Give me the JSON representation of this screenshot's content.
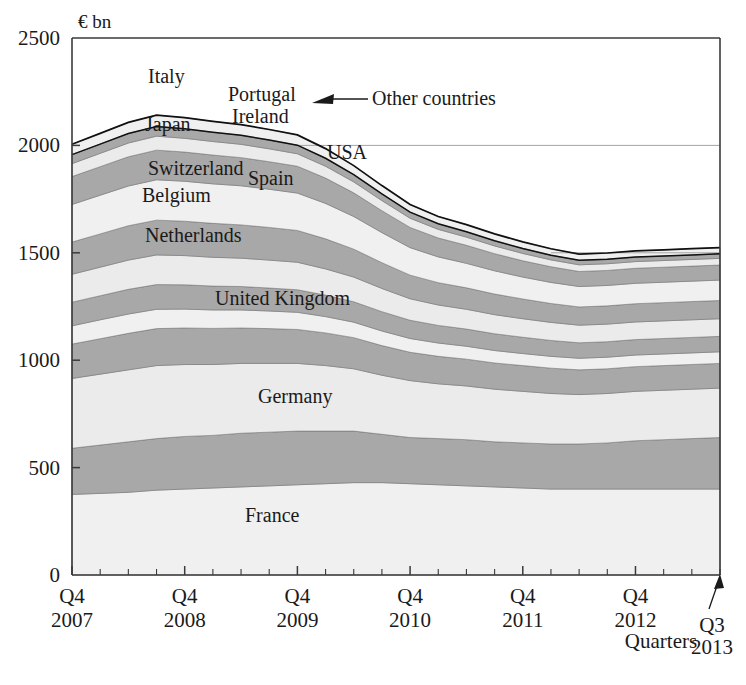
{
  "chart_data": {
    "type": "area",
    "title": "",
    "subtitle": "",
    "unit_label": "€ bn",
    "xlabel": "Quarters",
    "ylabel": "",
    "ylim": [
      0,
      2500
    ],
    "yticks": [
      0,
      500,
      1000,
      1500,
      2000,
      2500
    ],
    "ytick_labels": [
      "0",
      "500",
      "1000",
      "1500",
      "2000",
      "2500"
    ],
    "grid": "horizontal-faint-at-1500-and-2000",
    "legend": "inline-band-labels",
    "stacked": true,
    "x": [
      "Q4 2007",
      "Q1 2008",
      "Q2 2008",
      "Q3 2008",
      "Q4 2008",
      "Q1 2009",
      "Q2 2009",
      "Q3 2009",
      "Q4 2009",
      "Q1 2010",
      "Q2 2010",
      "Q3 2010",
      "Q4 2010",
      "Q1 2011",
      "Q2 2011",
      "Q3 2011",
      "Q4 2011",
      "Q1 2012",
      "Q2 2012",
      "Q3 2012",
      "Q4 2012",
      "Q1 2013",
      "Q2 2013",
      "Q3 2013"
    ],
    "xtick_labels": [
      {
        "q": "Q4",
        "year": "2007"
      },
      {
        "q": "Q4",
        "year": "2008"
      },
      {
        "q": "Q4",
        "year": "2009"
      },
      {
        "q": "Q4",
        "year": "2010"
      },
      {
        "q": "Q4",
        "year": "2011"
      },
      {
        "q": "Q4",
        "year": "2012"
      }
    ],
    "end_annotation": {
      "q": "Q3",
      "year": "2013"
    },
    "annotations": [
      {
        "text": "Other countries",
        "points_to": "top-thin-band"
      }
    ],
    "series": [
      {
        "name": "France",
        "shade": "light",
        "values": [
          375,
          380,
          385,
          395,
          400,
          405,
          410,
          415,
          420,
          425,
          430,
          430,
          425,
          420,
          415,
          410,
          405,
          400,
          400,
          400,
          400,
          400,
          400,
          400
        ]
      },
      {
        "name": "Germany",
        "shade": "dark",
        "values": [
          215,
          225,
          235,
          240,
          245,
          245,
          250,
          250,
          250,
          245,
          240,
          225,
          215,
          215,
          215,
          210,
          210,
          210,
          210,
          215,
          225,
          230,
          235,
          240
        ]
      },
      {
        "name": "United Kingdom",
        "shade": "light",
        "values": [
          325,
          330,
          335,
          340,
          335,
          330,
          325,
          320,
          315,
          305,
          290,
          275,
          265,
          255,
          250,
          245,
          240,
          235,
          230,
          230,
          230,
          230,
          230,
          230
        ]
      },
      {
        "name": "Netherlands",
        "shade": "dark",
        "values": [
          160,
          165,
          170,
          172,
          170,
          168,
          165,
          162,
          158,
          152,
          145,
          138,
          132,
          128,
          125,
          122,
          120,
          118,
          115,
          115,
          115,
          115,
          115,
          115
        ]
      },
      {
        "name": "Belgium",
        "shade": "light",
        "values": [
          85,
          88,
          90,
          90,
          88,
          86,
          84,
          82,
          80,
          76,
          72,
          68,
          64,
          62,
          60,
          58,
          56,
          55,
          54,
          54,
          54,
          54,
          54,
          54
        ]
      },
      {
        "name": "Switzerland",
        "shade": "dark",
        "values": [
          110,
          112,
          115,
          115,
          113,
          111,
          109,
          107,
          105,
          100,
          95,
          90,
          85,
          82,
          80,
          78,
          76,
          74,
          72,
          72,
          72,
          72,
          72,
          72
        ]
      },
      {
        "name": "Japan",
        "shade": "light",
        "values": [
          130,
          133,
          136,
          138,
          136,
          134,
          132,
          130,
          128,
          122,
          115,
          108,
          100,
          95,
          92,
          89,
          86,
          84,
          82,
          82,
          82,
          82,
          82,
          82
        ]
      },
      {
        "name": "Spain",
        "shade": "dark",
        "values": [
          150,
          155,
          160,
          162,
          160,
          158,
          155,
          152,
          148,
          140,
          130,
          120,
          110,
          104,
          100,
          96,
          92,
          88,
          85,
          85,
          85,
          85,
          85,
          85
        ]
      },
      {
        "name": "USA",
        "shade": "light",
        "values": [
          175,
          180,
          185,
          188,
          186,
          184,
          182,
          178,
          174,
          165,
          152,
          140,
          128,
          120,
          114,
          108,
          102,
          98,
          95,
          95,
          95,
          95,
          95,
          95
        ]
      },
      {
        "name": "Italy",
        "shade": "dark",
        "values": [
          130,
          133,
          136,
          138,
          136,
          134,
          131,
          128,
          125,
          118,
          110,
          102,
          94,
          88,
          84,
          80,
          76,
          73,
          70,
          70,
          70,
          70,
          70,
          70
        ]
      },
      {
        "name": "Ireland",
        "shade": "light",
        "values": [
          60,
          62,
          64,
          65,
          64,
          63,
          62,
          60,
          58,
          55,
          51,
          47,
          43,
          40,
          38,
          36,
          34,
          32,
          31,
          31,
          31,
          31,
          31,
          31
        ]
      },
      {
        "name": "Portugal",
        "shade": "dark",
        "values": [
          42,
          43,
          44,
          45,
          44,
          43,
          42,
          41,
          40,
          37,
          34,
          31,
          28,
          26,
          25,
          24,
          23,
          22,
          21,
          21,
          21,
          21,
          21,
          21
        ]
      },
      {
        "name": "Other countries",
        "shade": "light",
        "values": [
          48,
          50,
          52,
          53,
          52,
          51,
          50,
          49,
          48,
          45,
          42,
          39,
          36,
          34,
          33,
          32,
          31,
          30,
          29,
          29,
          29,
          29,
          29,
          29
        ]
      }
    ],
    "band_labels": [
      {
        "name": "France",
        "x": 245,
        "y": 522
      },
      {
        "name": "Germany",
        "x": 258,
        "y": 403
      },
      {
        "name": "United Kingdom",
        "x": 215,
        "y": 305
      },
      {
        "name": "Netherlands",
        "x": 145,
        "y": 242
      },
      {
        "name": "Belgium",
        "x": 142,
        "y": 202
      },
      {
        "name": "Switzerland",
        "x": 148,
        "y": 175
      },
      {
        "name": "Japan",
        "x": 145,
        "y": 131
      },
      {
        "name": "Spain",
        "x": 248,
        "y": 185
      },
      {
        "name": "USA",
        "x": 327,
        "y": 159
      },
      {
        "name": "Italy",
        "x": 148,
        "y": 83
      },
      {
        "name": "Ireland",
        "x": 232,
        "y": 123
      },
      {
        "name": "Portugal",
        "x": 228,
        "y": 101
      }
    ],
    "colors": {
      "light_band": "#f0f0f0",
      "dark_band": "#a8a8a8",
      "light_band_alt": "#ebebeb",
      "outline": "#111111",
      "axis": "#3a3a3a",
      "grid": "#9a9a9a",
      "text": "#1a1a1a",
      "background": "#ffffff"
    }
  },
  "annotation": {
    "other_countries": "Other countries"
  },
  "axis": {
    "unit": "€ bn",
    "x_title": "Quarters",
    "end_q": "Q3",
    "end_year": "2013"
  }
}
